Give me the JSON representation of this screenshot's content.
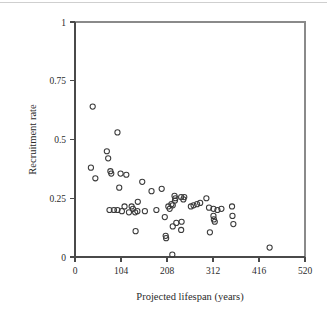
{
  "figure": {
    "background_color": "#ffffff",
    "marker_color": "#3b3b3b",
    "axis_color": "#4a4a4a",
    "frame_color": "#8a8a8a"
  },
  "chart_data": {
    "type": "scatter",
    "title": "",
    "xlabel": "Projected lifespan (years)",
    "ylabel": "Recruitment rate",
    "xlim": [
      0,
      520
    ],
    "ylim": [
      0,
      1
    ],
    "xticks": [
      0,
      104,
      208,
      312,
      416,
      520
    ],
    "xtick_labels": [
      "0",
      "104",
      "208",
      "312",
      "416",
      "520"
    ],
    "yticks": [
      0,
      0.25,
      0.5,
      0.75,
      1
    ],
    "ytick_labels": [
      "0",
      "0.25",
      "0.5",
      "0.75",
      "1"
    ],
    "grid": false,
    "legend": false,
    "marker_shape": "open-circle",
    "n_points": 63,
    "points": [
      [
        40,
        0.64
      ],
      [
        96,
        0.53
      ],
      [
        72,
        0.45
      ],
      [
        75,
        0.42
      ],
      [
        36,
        0.38
      ],
      [
        80,
        0.365
      ],
      [
        82,
        0.355
      ],
      [
        46,
        0.335
      ],
      [
        103,
        0.355
      ],
      [
        116,
        0.35
      ],
      [
        152,
        0.32
      ],
      [
        100,
        0.295
      ],
      [
        196,
        0.29
      ],
      [
        173,
        0.28
      ],
      [
        225,
        0.26
      ],
      [
        240,
        0.255
      ],
      [
        247,
        0.255
      ],
      [
        245,
        0.245
      ],
      [
        297,
        0.25
      ],
      [
        142,
        0.235
      ],
      [
        227,
        0.25
      ],
      [
        218,
        0.225
      ],
      [
        221,
        0.22
      ],
      [
        112,
        0.215
      ],
      [
        128,
        0.215
      ],
      [
        131,
        0.205
      ],
      [
        276,
        0.225
      ],
      [
        283,
        0.23
      ],
      [
        268,
        0.22
      ],
      [
        313,
        0.205
      ],
      [
        322,
        0.2
      ],
      [
        331,
        0.205
      ],
      [
        355,
        0.215
      ],
      [
        78,
        0.2
      ],
      [
        88,
        0.2
      ],
      [
        96,
        0.2
      ],
      [
        106,
        0.195
      ],
      [
        122,
        0.19
      ],
      [
        136,
        0.19
      ],
      [
        141,
        0.195
      ],
      [
        158,
        0.195
      ],
      [
        184,
        0.2
      ],
      [
        211,
        0.215
      ],
      [
        214,
        0.205
      ],
      [
        226,
        0.24
      ],
      [
        262,
        0.215
      ],
      [
        303,
        0.21
      ],
      [
        356,
        0.175
      ],
      [
        313,
        0.175
      ],
      [
        314,
        0.16
      ],
      [
        316,
        0.15
      ],
      [
        203,
        0.17
      ],
      [
        229,
        0.145
      ],
      [
        241,
        0.15
      ],
      [
        221,
        0.13
      ],
      [
        358,
        0.14
      ],
      [
        240,
        0.115
      ],
      [
        137,
        0.11
      ],
      [
        305,
        0.105
      ],
      [
        205,
        0.09
      ],
      [
        206,
        0.08
      ],
      [
        220,
        0.01
      ],
      [
        440,
        0.04
      ]
    ]
  }
}
